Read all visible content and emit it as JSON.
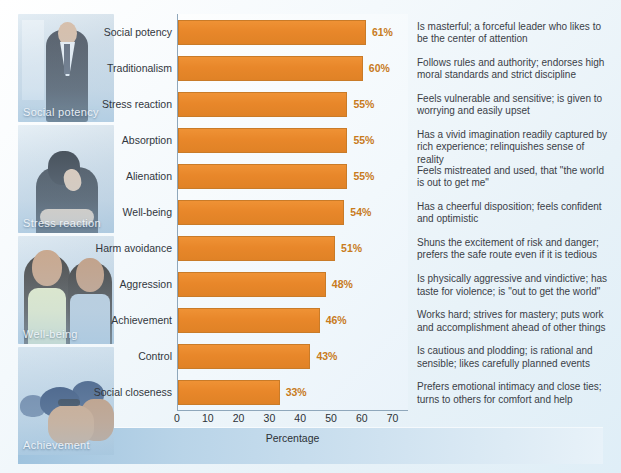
{
  "chart_data": {
    "type": "bar",
    "orientation": "horizontal",
    "title": "",
    "xlabel": "Percentage",
    "ylabel": "",
    "xlim": [
      0,
      75
    ],
    "xticks": [
      0,
      10,
      20,
      30,
      40,
      50,
      60,
      70
    ],
    "grid": false,
    "legend": "none",
    "bar_color": "#e8872a",
    "value_label_color": "#c87b1c",
    "categories": [
      "Social potency",
      "Traditionalism",
      "Stress reaction",
      "Absorption",
      "Alienation",
      "Well-being",
      "Harm avoidance",
      "Aggression",
      "Achievement",
      "Control",
      "Social closeness"
    ],
    "values": [
      61,
      60,
      55,
      55,
      55,
      54,
      51,
      48,
      46,
      43,
      33
    ],
    "value_labels": [
      "61%",
      "60%",
      "55%",
      "55%",
      "55%",
      "54%",
      "51%",
      "48%",
      "46%",
      "43%",
      "33%"
    ],
    "descriptions": [
      "Is masterful; a forceful leader who likes to be the center of attention",
      "Follows rules and authority; endorses high moral standards and strict discipline",
      "Feels vulnerable and sensitive; is given to worrying and easily upset",
      "Has a vivid imagination readily captured by rich experience; relinquishes sense of reality",
      "Feels mistreated and used, that \"the world is out to get me\"",
      "Has a cheerful disposition; feels confident and optimistic",
      "Shuns the excitement of risk and danger; prefers the safe route even if it is tedious",
      "Is physically aggressive and vindictive; has taste for violence; is \"out to get the world\"",
      "Works hard; strives for mastery; puts work and accomplishment ahead of other things",
      "Is cautious and plodding; is rational and sensible; likes carefully planned events",
      "Prefers emotional intimacy and close ties; turns to others for comfort and help"
    ]
  },
  "photos": [
    {
      "caption": "Social potency",
      "alt": "businessman-portrait-photo"
    },
    {
      "caption": "Stress reaction",
      "alt": "person-head-in-hands-photo"
    },
    {
      "caption": "Well-being",
      "alt": "smiling-couple-photo"
    },
    {
      "caption": "Achievement",
      "alt": "swimmers-racing-photo"
    }
  ]
}
